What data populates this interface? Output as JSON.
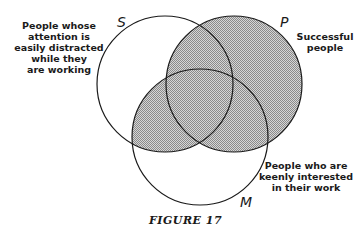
{
  "figure": {
    "caption": "FIGURE 17",
    "circles": [
      {
        "letter": "S",
        "label_lines": [
          "People whose",
          "attention  is",
          "easily distracted",
          "while they",
          "are working"
        ],
        "cx": 165,
        "cy": 84,
        "r": 68
      },
      {
        "letter": "P",
        "label_lines": [
          "Successful",
          "people"
        ],
        "cx": 234,
        "cy": 84,
        "r": 68
      },
      {
        "letter": "M",
        "label_lines": [
          "People who are",
          "keenly interested",
          "in their work"
        ],
        "cx": 200,
        "cy": 137,
        "r": 68
      }
    ],
    "shaded_regions": [
      "P",
      "S ∩ M"
    ],
    "colors": {
      "stroke": "#1a1a1a",
      "shade": "#9a9a9a",
      "background": "#ffffff"
    }
  }
}
